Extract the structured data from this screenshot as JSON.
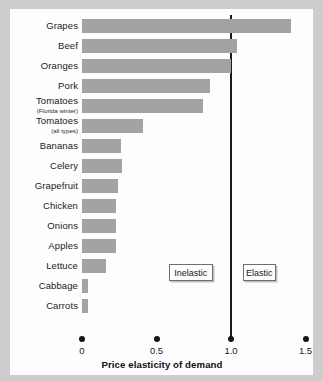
{
  "chart_data": {
    "type": "bar",
    "orientation": "horizontal",
    "title": "",
    "xlabel": "Price elasticity of demand",
    "ylabel": "",
    "xlim": [
      0,
      1.5
    ],
    "xticks": [
      "0",
      "0.5",
      "1.0",
      "1.5"
    ],
    "xtick_values": [
      0,
      0.5,
      1.0,
      1.5
    ],
    "grid": false,
    "legend": "none",
    "reference_line": {
      "value": 1.0,
      "label": "unit elastic boundary"
    },
    "categories": [
      "Grapes",
      "Beef",
      "Oranges",
      "Pork",
      "Tomatoes",
      "Tomatoes",
      "Bananas",
      "Celery",
      "Grapefruit",
      "Chicken",
      "Onions",
      "Apples",
      "Lettuce",
      "Cabbage",
      "Carrots"
    ],
    "category_sublabels": [
      "",
      "",
      "",
      "",
      "(Florida winter)",
      "(all types)",
      "",
      "",
      "",
      "",
      "",
      "",
      "",
      "",
      ""
    ],
    "values": [
      1.4,
      1.04,
      1.0,
      0.86,
      0.81,
      0.41,
      0.26,
      0.27,
      0.24,
      0.23,
      0.23,
      0.23,
      0.16,
      0.04,
      0.04
    ],
    "bar_color": "#a3a3a3",
    "annotations": [
      {
        "text": "Inelastic",
        "x": 0.73
      },
      {
        "text": "Elastic",
        "x": 1.19
      }
    ]
  },
  "annotations": {
    "inelastic": "Inelastic",
    "elastic": "Elastic"
  }
}
